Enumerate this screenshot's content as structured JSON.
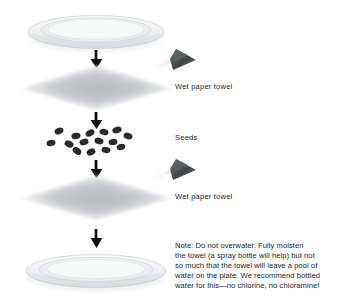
{
  "figure": {
    "background": "#ffffff",
    "ink": "#20252a"
  },
  "labels": [
    {
      "id": "towel-top",
      "text": "Wet paper towel",
      "x": 175,
      "y": 86
    },
    {
      "id": "seeds",
      "text": "Seeds",
      "x": 175,
      "y": 137
    },
    {
      "id": "towel-bottom",
      "text": "Wet paper towel",
      "x": 175,
      "y": 196
    }
  ],
  "note": {
    "lines": [
      "Note: Do not overwater. Fully moisten",
      "the towel (a spray bottle will help) but not",
      "so much that the towel will leave a pool of",
      "water on the plate. We recommend bottled",
      "water for this—no chlorine, no chloramine!"
    ]
  },
  "components": [
    {
      "id": "plate-top",
      "name": "plate",
      "cy": 32,
      "note": "upturned plate, rim and inner well"
    },
    {
      "id": "towel-top",
      "name": "paper-towel",
      "cy": 88,
      "note": "wet paper towel sheet"
    },
    {
      "id": "seeds",
      "name": "seed-cluster",
      "cy": 138,
      "count": 15
    },
    {
      "id": "towel-bottom",
      "name": "paper-towel",
      "cy": 198,
      "note": "wet paper towel sheet"
    },
    {
      "id": "plate-bottom",
      "name": "plate",
      "cy": 271,
      "note": "base plate"
    }
  ],
  "arrows": [
    {
      "id": "arrow-1",
      "x": 96,
      "y1": 50,
      "y2": 68
    },
    {
      "id": "arrow-2",
      "x": 96,
      "y1": 112,
      "y2": 128
    },
    {
      "id": "arrow-3",
      "x": 96,
      "y1": 158,
      "y2": 176
    },
    {
      "id": "arrow-4",
      "x": 96,
      "y1": 228,
      "y2": 248
    }
  ],
  "sprayers": [
    {
      "id": "sprayer-top",
      "x": 180,
      "y": 56,
      "note": "spray nozzle misting the upper towel"
    },
    {
      "id": "sprayer-bottom",
      "x": 180,
      "y": 166,
      "note": "spray nozzle misting the lower towel"
    }
  ],
  "colors": {
    "plate_outline": "#c9ccce",
    "plate_fill": "#f3f4f5",
    "plate_shade": "#dcdfe1",
    "towel_light": "#f2f3f3",
    "towel_mid": "#d3d6d7",
    "towel_dark": "#a8acae",
    "seed": "#2b2b2b",
    "arrow": "#111111",
    "spray_dark": "#4a4e51",
    "spray_light": "#e8eaeb"
  }
}
